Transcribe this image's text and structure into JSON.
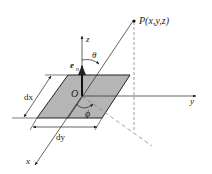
{
  "diagram": {
    "labels": {
      "point": "P(x,y,z)",
      "z_axis": "z",
      "y_axis": "y",
      "x_axis": "x",
      "origin": "O",
      "normal_vector": "e",
      "normal_subscript": "n",
      "polar_angle": "θ",
      "azimuth_angle": "ϕ",
      "dx": "dx",
      "dy": "dy"
    },
    "colors": {
      "line": "#222222",
      "element_fill": "#b8b8b8",
      "dashed": "#777777"
    }
  }
}
